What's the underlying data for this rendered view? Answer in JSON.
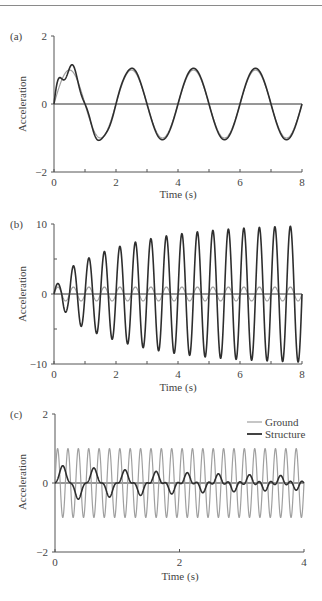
{
  "chart_data": [
    {
      "type": "line",
      "panel_label": "(a)",
      "title": "",
      "xlabel": "Time (s)",
      "ylabel": "Acceleration",
      "xlim": [
        0,
        8
      ],
      "ylim": [
        -2,
        2
      ],
      "xticks": [
        0,
        2,
        4,
        6,
        8
      ],
      "xtick_labels": [
        "0",
        "2",
        "4",
        "6",
        "8"
      ],
      "xminor_step": 1,
      "yticks": [
        -2,
        0,
        2
      ],
      "ytick_labels": [
        "−2",
        "0",
        "2"
      ],
      "yminor_step": 0,
      "grid": false,
      "series": [
        {
          "name": "Ground",
          "color": "#a0a0a0",
          "width": 1.2,
          "model": {
            "kind": "sine",
            "amp": 1.0,
            "freq": 0.5
          }
        },
        {
          "name": "Structure",
          "color": "#2e2e2e",
          "width": 1.6,
          "model": {
            "kind": "response",
            "amp": 1.05,
            "freq": 0.5,
            "transient_amp": 0.35,
            "transient_freq": 2.0,
            "transient_decay": 1.3
          }
        }
      ],
      "x": [
        0,
        0.4,
        1.0,
        1.6,
        2.5,
        3.0,
        3.5,
        4.5,
        5.0,
        5.5,
        6.5,
        7.0,
        7.5,
        8.0
      ],
      "sample_values": {
        "Ground": [
          0,
          0.95,
          0,
          -1.0,
          1.0,
          0,
          -1.0,
          1.0,
          0,
          -1.0,
          1.0,
          0,
          -1.0,
          0
        ],
        "Structure": [
          0,
          1.2,
          0.1,
          -1.1,
          1.1,
          0,
          -1.05,
          1.05,
          0,
          -1.05,
          1.05,
          0,
          -1.05,
          0
        ]
      },
      "legend": null
    },
    {
      "type": "line",
      "panel_label": "(b)",
      "title": "",
      "xlabel": "Time (s)",
      "ylabel": "Acceleration",
      "xlim": [
        0,
        8
      ],
      "ylim": [
        -10,
        10
      ],
      "xticks": [
        0,
        2,
        4,
        6,
        8
      ],
      "xtick_labels": [
        "0",
        "2",
        "4",
        "6",
        "8"
      ],
      "xminor_step": 1,
      "yticks": [
        -10,
        0,
        10
      ],
      "ytick_labels": [
        "−10",
        "0",
        "10"
      ],
      "yminor_step": 5,
      "grid": false,
      "series": [
        {
          "name": "Ground",
          "color": "#a0a0a0",
          "width": 1.2,
          "model": {
            "kind": "sine",
            "amp": 1.0,
            "freq": 2.0
          }
        },
        {
          "name": "Structure",
          "color": "#2e2e2e",
          "width": 1.6,
          "model": {
            "kind": "resonance",
            "amp_final": 10.0,
            "freq": 2.0,
            "growth_rate": 0.42
          }
        }
      ],
      "x": [
        0.25,
        0.75,
        1.25,
        1.75,
        2.25,
        2.75,
        3.25,
        3.75,
        4.25,
        4.75,
        5.25,
        5.75,
        6.25,
        6.75,
        7.25,
        7.75
      ],
      "sample_values": {
        "Structure_peaks": [
          1.5,
          3.8,
          5.5,
          6.7,
          7.6,
          8.2,
          8.7,
          9.1,
          9.4,
          9.6,
          9.7,
          9.8,
          9.9,
          9.9,
          10.0,
          10.0
        ],
        "Structure_troughs": [
          -2.6,
          -4.6,
          -6.1,
          -7.1,
          -7.8,
          -8.3,
          -8.8,
          -9.1,
          -9.4,
          -9.6,
          -9.7,
          -9.8,
          -9.9,
          -9.9,
          -10.0,
          -10.0
        ]
      },
      "legend": null
    },
    {
      "type": "line",
      "panel_label": "(c)",
      "title": "",
      "xlabel": "Time (s)",
      "ylabel": "Acceleration",
      "xlim": [
        0,
        4
      ],
      "ylim": [
        -2,
        2
      ],
      "xticks": [
        0,
        2,
        4
      ],
      "xtick_labels": [
        "0",
        "2",
        "4"
      ],
      "xminor_step": 0,
      "yticks": [
        -2,
        0,
        2
      ],
      "ytick_labels": [
        "−2",
        "0",
        "2"
      ],
      "yminor_step": 0,
      "grid": false,
      "series": [
        {
          "name": "Ground",
          "color": "#a0a0a0",
          "width": 1.2,
          "model": {
            "kind": "sine",
            "amp": 1.0,
            "freq": 6.0
          }
        },
        {
          "name": "Structure",
          "color": "#2e2e2e",
          "width": 1.6,
          "model": {
            "kind": "isolated",
            "amp_forced": 0.1,
            "freq": 6.0,
            "free_amp": 0.42,
            "free_freq": 2.0,
            "free_decay": 0.35
          }
        }
      ],
      "x": [
        0.12,
        0.37,
        0.62,
        0.87,
        1.12,
        1.37,
        1.62,
        1.87,
        2.12,
        3.62,
        3.87
      ],
      "sample_values": {
        "Structure": [
          0.45,
          -0.42,
          0.36,
          -0.33,
          0.29,
          -0.27,
          0.22,
          -0.22,
          0.2,
          0.15,
          -0.15
        ]
      },
      "legend": {
        "position": "upper right",
        "entries": [
          {
            "label": "Ground",
            "color": "#a0a0a0"
          },
          {
            "label": "Structure",
            "color": "#2e2e2e"
          }
        ]
      }
    }
  ],
  "layout": {
    "panels": [
      {
        "x0": 54,
        "x1": 302,
        "y_top": 36,
        "y_zero": 104,
        "y_bottom": 172
      },
      {
        "x0": 54,
        "x1": 302,
        "y_top": 224,
        "y_zero": 294,
        "y_bottom": 364
      },
      {
        "x0": 55,
        "x1": 304,
        "y_top": 414,
        "y_zero": 482,
        "y_bottom": 552
      }
    ]
  }
}
